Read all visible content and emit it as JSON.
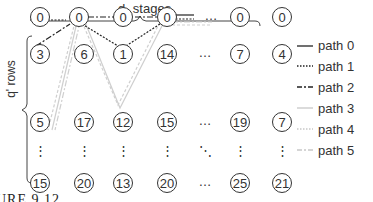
{
  "title": {
    "main": "d",
    "sub": "c",
    "rest": " stages"
  },
  "side_label": "q' rows",
  "grid": {
    "rows": [
      [
        "0",
        "0",
        "0",
        "0",
        "0",
        "0"
      ],
      [
        "3",
        "6",
        "1",
        "14",
        "7",
        "4"
      ],
      [
        "5",
        "17",
        "12",
        "15",
        "19",
        "7"
      ],
      [
        "15",
        "20",
        "13",
        "20",
        "25",
        "21"
      ]
    ]
  },
  "ellipsis": {
    "h": "…",
    "v": "⋮",
    "d": "⋱"
  },
  "legend": [
    {
      "label": "path 0",
      "style": "solid",
      "color": "#222222"
    },
    {
      "label": "path 1",
      "style": "dotted",
      "color": "#222222"
    },
    {
      "label": "path 2",
      "style": "dashdot",
      "color": "#222222"
    },
    {
      "label": "path 3",
      "style": "solid",
      "color": "#c8c8c8"
    },
    {
      "label": "path 4",
      "style": "dotted",
      "color": "#c8c8c8"
    },
    {
      "label": "path 5",
      "style": "dashdot",
      "color": "#c8c8c8"
    }
  ],
  "caption": "URE 9.12"
}
